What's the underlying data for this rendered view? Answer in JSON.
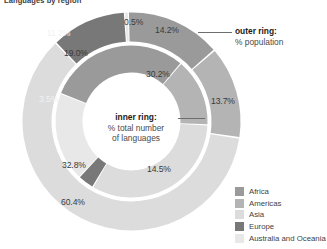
{
  "title": "Languages by region",
  "annotations": {
    "outer": {
      "head": "outer ring:",
      "sub": "% population"
    },
    "inner": {
      "head": "inner ring:",
      "sub1": "% total number",
      "sub2": "of languages"
    }
  },
  "legend": {
    "items": [
      {
        "label": "Africa",
        "color": "#9a9a9a"
      },
      {
        "label": "Americas",
        "color": "#b4b4b4"
      },
      {
        "label": "Asia",
        "color": "#dcdcdc"
      },
      {
        "label": "Europe",
        "color": "#787878"
      },
      {
        "label": "Australia and Oceania",
        "color": "#e8e8e8"
      }
    ]
  },
  "chart_data": {
    "type": "pie",
    "title": "Languages by region",
    "legend_position": "bottom-right",
    "subtype": "nested-donut",
    "categories": [
      "Africa",
      "Americas",
      "Asia",
      "Europe",
      "Australia and Oceania"
    ],
    "colors": [
      "#9a9a9a",
      "#b4b4b4",
      "#dcdcdc",
      "#787878",
      "#e8e8e8"
    ],
    "series": [
      {
        "name": "outer ring",
        "description": "% population",
        "unit": "%",
        "values": [
          14.2,
          13.7,
          60.4,
          11.2,
          0.5
        ],
        "labels": [
          "14.2%",
          "13.7%",
          "60.4%",
          "11.2%",
          "0.5%"
        ]
      },
      {
        "name": "inner ring",
        "description": "% total number of languages",
        "unit": "%",
        "values": [
          30.2,
          14.5,
          32.8,
          3.5,
          19.0
        ],
        "labels": [
          "30.2%",
          "14.5%",
          "32.8%",
          "3.5%",
          "19.0%"
        ]
      }
    ]
  },
  "labels": {
    "outer": {
      "africa": "14.2%",
      "americas": "13.7%",
      "asia": "60.4%",
      "europe": "11.2%",
      "australia": "0.5%"
    },
    "inner": {
      "africa": "30.2%",
      "americas": "14.5%",
      "asia": "32.8%",
      "europe": "3.5%",
      "australia": "19.0%"
    }
  }
}
